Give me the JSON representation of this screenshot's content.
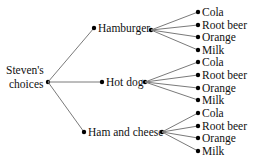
{
  "diagram": {
    "root": {
      "label_line1": "Steven's",
      "label_line2": "choices"
    },
    "sandwiches": [
      {
        "label": "Hamburger",
        "drinks": [
          "Cola",
          "Root beer",
          "Orange",
          "Milk"
        ]
      },
      {
        "label": "Hot dog",
        "drinks": [
          "Cola",
          "Root beer",
          "Orange",
          "Milk"
        ]
      },
      {
        "label": "Ham and cheese",
        "drinks": [
          "Cola",
          "Root beer",
          "Orange",
          "Milk"
        ]
      }
    ],
    "colors": {
      "edge": "#7a7a7a",
      "node": "#000000",
      "text": "#111111"
    }
  }
}
